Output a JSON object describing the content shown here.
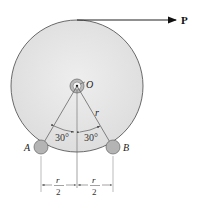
{
  "diagram": {
    "labels": {
      "force": "P",
      "center": "O",
      "radius": "r",
      "roller_left": "A",
      "roller_right": "B",
      "angle_left": "30°",
      "angle_right": "30°",
      "dim_left_num": "r",
      "dim_left_den": "2",
      "dim_right_num": "r",
      "dim_right_den": "2"
    },
    "colors": {
      "disk_fill": "#e6e6e6",
      "disk_stroke": "#5a5a5a",
      "roller_fill": "#b4b4b4",
      "line": "#444444",
      "arrow": "#111111"
    }
  }
}
